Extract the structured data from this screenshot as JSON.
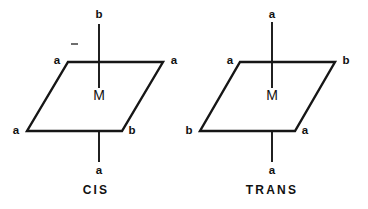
{
  "figure": {
    "background_color": "#ffffff",
    "line_color": "#161616",
    "text_color": "#111111"
  },
  "isomers": [
    {
      "id": "cis",
      "caption": "CIS",
      "metal_label": "M",
      "ligands": {
        "axial_top": "b",
        "axial_bottom": "a",
        "plane_top_left": "a",
        "plane_top_right": "a",
        "plane_bottom_left": "a",
        "plane_bottom_right": "b"
      }
    },
    {
      "id": "trans",
      "caption": "TRANS",
      "metal_label": "M",
      "ligands": {
        "axial_top": "a",
        "axial_bottom": "a",
        "plane_top_left": "a",
        "plane_top_right": "b",
        "plane_bottom_left": "b",
        "plane_bottom_right": "a"
      }
    }
  ]
}
